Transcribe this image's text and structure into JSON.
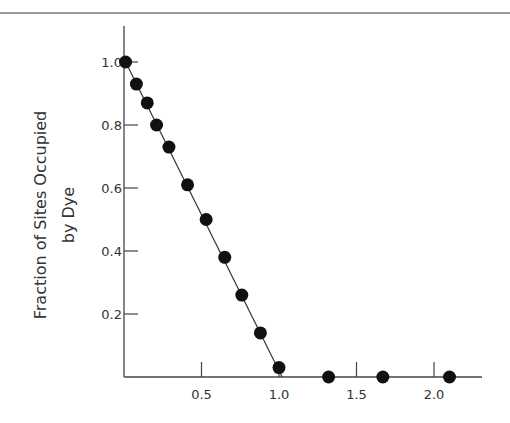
{
  "chart_data": {
    "type": "scatter",
    "title": "",
    "xlabel": "",
    "ylabel": "Fraction of Sites Occupied by Dye",
    "ylabel_lines": [
      "Fraction of Sites Occupied",
      "by Dye"
    ],
    "xlim": [
      0,
      2.3
    ],
    "ylim": [
      0,
      1.1
    ],
    "grid": false,
    "legend": null,
    "x_ticks": [
      0.5,
      1.0,
      1.5,
      2.0
    ],
    "x_tick_labels": [
      "0.5",
      "1.0",
      "1.5",
      "2.0"
    ],
    "y_ticks": [
      0.2,
      0.4,
      0.6,
      0.8,
      1.0
    ],
    "y_tick_labels": [
      "0.2",
      "0.4",
      "0.6",
      "0.8",
      "1.0"
    ],
    "series": [
      {
        "name": "data",
        "marker": "filled-circle",
        "x": [
          0.01,
          0.08,
          0.15,
          0.21,
          0.29,
          0.41,
          0.53,
          0.65,
          0.76,
          0.88,
          1.0,
          1.32,
          1.67,
          2.1
        ],
        "y": [
          1.0,
          0.93,
          0.87,
          0.8,
          0.73,
          0.61,
          0.5,
          0.38,
          0.26,
          0.14,
          0.03,
          0.0,
          0.0,
          0.0
        ]
      }
    ],
    "fit_line": {
      "x": [
        0.0,
        1.02
      ],
      "y": [
        1.01,
        0.0
      ]
    }
  }
}
